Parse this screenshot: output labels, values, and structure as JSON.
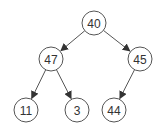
{
  "diagram": {
    "type": "binary-tree",
    "nodes": [
      {
        "id": "n40",
        "label": "40",
        "x": 94,
        "y": 23
      },
      {
        "id": "n47",
        "label": "47",
        "x": 51,
        "y": 59
      },
      {
        "id": "n45",
        "label": "45",
        "x": 140,
        "y": 59
      },
      {
        "id": "n11",
        "label": "11",
        "x": 26,
        "y": 110
      },
      {
        "id": "n3",
        "label": "3",
        "x": 77,
        "y": 110
      },
      {
        "id": "n44",
        "label": "44",
        "x": 114,
        "y": 110
      }
    ],
    "edges": [
      {
        "from": "n40",
        "to": "n47"
      },
      {
        "from": "n40",
        "to": "n45"
      },
      {
        "from": "n47",
        "to": "n11"
      },
      {
        "from": "n47",
        "to": "n3"
      },
      {
        "from": "n45",
        "to": "n44"
      }
    ],
    "colors": {
      "stroke": "#555555",
      "text": "#333333",
      "fill": "#ffffff"
    }
  }
}
